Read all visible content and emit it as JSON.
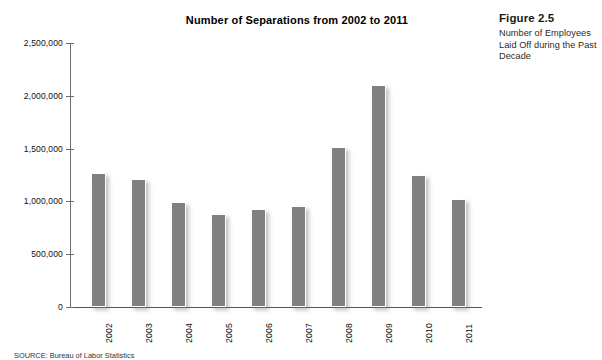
{
  "figure": {
    "number_label": "Figure 2.5",
    "caption": "Number of Employees Laid Off during the Past Decade"
  },
  "source": {
    "text": "SOURCE: Bureau of Labor Statistics"
  },
  "chart_data": {
    "type": "bar",
    "title": "Number of Separations from 2002 to 2011",
    "xlabel": "",
    "ylabel": "",
    "categories": [
      "2002",
      "2003",
      "2004",
      "2005",
      "2006",
      "2007",
      "2008",
      "2009",
      "2010",
      "2011"
    ],
    "values": [
      1265000,
      1215000,
      990000,
      880000,
      930000,
      955000,
      1515000,
      2100000,
      1250000,
      1025000
    ],
    "ylim": [
      0,
      2500000
    ],
    "ytick_values": [
      2500000,
      2000000,
      1500000,
      1000000,
      500000,
      0
    ],
    "ytick_labels": [
      "2,500,000",
      "2,000,000",
      "1,500,000",
      "1,000,000",
      "500,000",
      "0"
    ],
    "grid": false,
    "legend": false,
    "bar_color": "#808080"
  }
}
